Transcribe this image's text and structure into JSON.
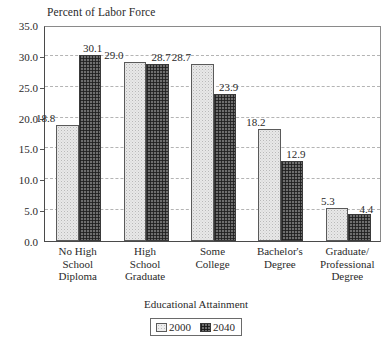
{
  "chart_data": {
    "type": "bar",
    "title": "Percent of Labor Force",
    "xlabel": "Educational Attainment",
    "ylabel": "",
    "ylim": [
      0.0,
      35.0
    ],
    "ytick_labels": [
      "0.0",
      "5.0",
      "10.0",
      "15.0",
      "20.0",
      "25.0",
      "30.0",
      "35.0"
    ],
    "ytick_values": [
      0.0,
      5.0,
      10.0,
      15.0,
      20.0,
      25.0,
      30.0,
      35.0
    ],
    "grid": "horizontal-dashed",
    "legend_position": "below-plot-center",
    "categories": [
      "No High\nSchool\nDiploma",
      "High\nSchool\nGraduate",
      "Some\nCollege",
      "Bachelor's\nDegree",
      "Graduate/\nProfessional\nDegree"
    ],
    "category_lines": [
      [
        "No High",
        "School",
        "Diploma"
      ],
      [
        "High",
        "School",
        "Graduate"
      ],
      [
        "Some",
        "College"
      ],
      [
        "Bachelor's",
        "Degree"
      ],
      [
        "Graduate/",
        "Professional",
        "Degree"
      ]
    ],
    "series": [
      {
        "name": "2000",
        "values": [
          18.8,
          29.0,
          28.7,
          18.2,
          5.3
        ],
        "labels": [
          "18.8",
          "29.0",
          "28.7",
          "18.2",
          "5.3"
        ],
        "pattern": "light-stipple",
        "color": "#e8e8e8"
      },
      {
        "name": "2040",
        "values": [
          30.1,
          28.7,
          23.9,
          12.9,
          4.4
        ],
        "labels": [
          "30.1",
          "28.7",
          "23.9",
          "12.9",
          "4.4"
        ],
        "pattern": "dark-crosshatch",
        "color": "#6e6e6e"
      }
    ]
  },
  "legend": {
    "entries": [
      {
        "label": "2000",
        "swatch": "light-stipple-swatch"
      },
      {
        "label": "2040",
        "swatch": "dark-crosshatch-swatch"
      }
    ]
  },
  "colors": {
    "background": "#ffffff",
    "axis": "#4a4a4a",
    "gridline": "#b4b4b4",
    "text": "#2a2a2a",
    "series_2000": "#e8e8e8",
    "series_2040": "#6e6e6e"
  }
}
